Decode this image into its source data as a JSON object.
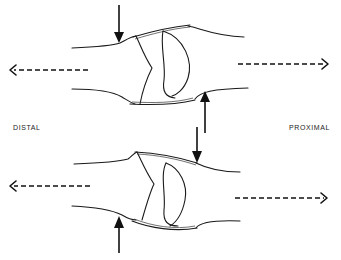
{
  "diagram": {
    "labels": {
      "distal": "DISTAL",
      "proximal": "PROXIMAL"
    },
    "panels": [
      {
        "id": "top-joint",
        "description": "Joint with dorsal force applied distally and palmar force proximally",
        "force_arrows": [
          {
            "direction": "down",
            "position": "distal-dorsal"
          },
          {
            "direction": "up",
            "position": "proximal-palmar"
          }
        ],
        "traction_arrows": [
          {
            "direction": "left",
            "side": "distal"
          },
          {
            "direction": "right",
            "side": "proximal"
          }
        ]
      },
      {
        "id": "bottom-joint",
        "description": "Joint with palmar force applied distally and dorsal force proximally",
        "force_arrows": [
          {
            "direction": "down",
            "position": "proximal-dorsal"
          },
          {
            "direction": "up",
            "position": "distal-palmar"
          }
        ],
        "traction_arrows": [
          {
            "direction": "left",
            "side": "distal"
          },
          {
            "direction": "right",
            "side": "proximal"
          }
        ]
      }
    ],
    "colors": {
      "line": "#1a1a1a",
      "background": "#ffffff"
    }
  }
}
